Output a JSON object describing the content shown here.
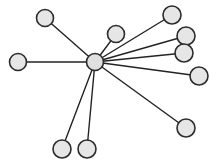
{
  "figure": {
    "name": "star-graph",
    "type": "node-link-diagram",
    "width": 221,
    "height": 167,
    "background_color": "#ffffff",
    "title": "",
    "caption": ""
  },
  "style": {
    "node_fill": "#e6e6e6",
    "node_stroke": "#2b2b2b",
    "node_stroke_width": 1.6,
    "hub_fill": "#e0e0e0",
    "hub_stroke": "#2b2b2b",
    "edge_color": "#232323",
    "edge_width": 1.4
  },
  "chart_data": {
    "type": "scatter",
    "title": "",
    "xlabel": "",
    "ylabel": "",
    "xlim": [
      0,
      221
    ],
    "ylim": [
      0,
      167
    ],
    "grid": false,
    "legend": "none",
    "layout": "star / hub-and-spoke",
    "node_count": 11,
    "edge_count": 10,
    "hub_degree": 10,
    "leaf_degree": 1,
    "nodes": [
      {
        "id": "n0",
        "label": "",
        "role": "hub",
        "x": 95,
        "y": 62,
        "r": 8.5,
        "degree": 10
      },
      {
        "id": "n1",
        "label": "",
        "role": "leaf",
        "x": 45,
        "y": 18,
        "r": 8.5,
        "degree": 1
      },
      {
        "id": "n2",
        "label": "",
        "role": "leaf",
        "x": 18,
        "y": 62,
        "r": 8.5,
        "degree": 1
      },
      {
        "id": "n3",
        "label": "",
        "role": "leaf",
        "x": 116,
        "y": 34,
        "r": 8.5,
        "degree": 1
      },
      {
        "id": "n4",
        "label": "",
        "role": "leaf",
        "x": 172,
        "y": 15,
        "r": 9.0,
        "degree": 1
      },
      {
        "id": "n5",
        "label": "",
        "role": "leaf",
        "x": 186,
        "y": 36,
        "r": 9.0,
        "degree": 1
      },
      {
        "id": "n6",
        "label": "",
        "role": "leaf",
        "x": 184,
        "y": 53,
        "r": 9.0,
        "degree": 1
      },
      {
        "id": "n7",
        "label": "",
        "role": "leaf",
        "x": 199,
        "y": 76,
        "r": 9.0,
        "degree": 1
      },
      {
        "id": "n8",
        "label": "",
        "role": "leaf",
        "x": 186,
        "y": 128,
        "r": 9.0,
        "degree": 1
      },
      {
        "id": "n9",
        "label": "",
        "role": "leaf",
        "x": 62,
        "y": 149,
        "r": 9.0,
        "degree": 1
      },
      {
        "id": "n10",
        "label": "",
        "role": "leaf",
        "x": 87,
        "y": 149,
        "r": 9.0,
        "degree": 1
      }
    ],
    "edges": [
      {
        "id": "e1",
        "source": "n0",
        "target": "n1",
        "label": ""
      },
      {
        "id": "e2",
        "source": "n0",
        "target": "n2",
        "label": ""
      },
      {
        "id": "e3",
        "source": "n0",
        "target": "n3",
        "label": ""
      },
      {
        "id": "e4",
        "source": "n0",
        "target": "n4",
        "label": ""
      },
      {
        "id": "e5",
        "source": "n0",
        "target": "n5",
        "label": ""
      },
      {
        "id": "e6",
        "source": "n0",
        "target": "n6",
        "label": ""
      },
      {
        "id": "e7",
        "source": "n0",
        "target": "n7",
        "label": ""
      },
      {
        "id": "e8",
        "source": "n0",
        "target": "n8",
        "label": ""
      },
      {
        "id": "e9",
        "source": "n0",
        "target": "n9",
        "label": ""
      },
      {
        "id": "e10",
        "source": "n0",
        "target": "n10",
        "label": ""
      }
    ]
  }
}
